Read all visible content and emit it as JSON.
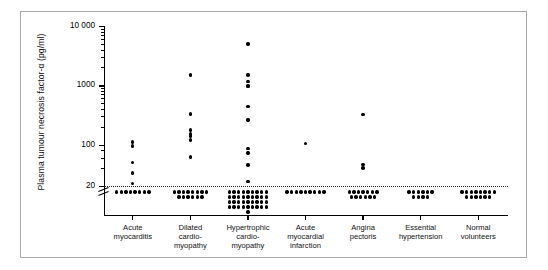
{
  "figure": {
    "background_color": "#ffffff",
    "border_color": "#a8a8a8",
    "marker_color": "#000000",
    "threshold_line_color": "#222222"
  },
  "axes": {
    "y_title": "Plasma tumour necrosis factor-α (pg/ml)",
    "y_tick_labels": [
      "10 000",
      "1000",
      "100",
      "20"
    ],
    "y_scale": "log",
    "y_axis_break": true,
    "x_title": ""
  },
  "chart_data": {
    "type": "scatter",
    "title": "",
    "subtitle": "",
    "xlabel": "",
    "ylabel": "Plasma tumour necrosis factor-α (pg/ml)",
    "yscale": "log",
    "ylim": [
      10,
      10000
    ],
    "yticks": [
      20,
      100,
      1000,
      10000
    ],
    "ytick_labels": [
      "20",
      "100",
      "1000",
      "10 000"
    ],
    "grid": false,
    "legend": "none",
    "annotations": [
      {
        "type": "hline",
        "value": 20,
        "style": "dotted",
        "label": "20",
        "note": "detection/normal upper reference limit"
      },
      {
        "type": "axis-break",
        "axis": "y",
        "below": 20,
        "note": "values below 20 pg/ml plotted as undetectable band"
      }
    ],
    "categories": [
      "Acute myocarditis",
      "Dilated cardiomyopathy",
      "Hypertrophic cardiomyopathy",
      "Acute myocardial infarction",
      "Angina pectoris",
      "Essential hypertension",
      "Normal volunteers"
    ],
    "category_labels_wrapped": [
      "Acute\nmyocarditis",
      "Dilated\ncardio-\nmyopathy",
      "Hypertrophic\ncardio-\nmyopathy",
      "Acute\nmyocardial\ninfarction",
      "Angina\npectoris",
      "Essential\nhypertension",
      "Normal\nvolunteers"
    ],
    "series": [
      {
        "name": "Acute myocarditis",
        "detected_values": [
          110,
          95,
          50,
          33,
          22
        ],
        "below_threshold_count": 8
      },
      {
        "name": "Dilated cardiomyopathy",
        "detected_values": [
          1500,
          330,
          175,
          150,
          140,
          120,
          62
        ],
        "below_threshold_count": 14
      },
      {
        "name": "Hypertrophic cardiomyopathy",
        "detected_values": [
          5000,
          1500,
          1150,
          1000,
          950,
          440,
          260,
          85,
          72,
          45,
          24
        ],
        "below_threshold_count": 37
      },
      {
        "name": "Acute myocardial infarction",
        "detected_values": [
          105
        ],
        "below_threshold_count": 9
      },
      {
        "name": "Angina pectoris",
        "detected_values": [
          320,
          46,
          40
        ],
        "below_threshold_count": 13
      },
      {
        "name": "Essential hypertension",
        "detected_values": [],
        "below_threshold_count": 10
      },
      {
        "name": "Normal volunteers",
        "detected_values": [],
        "below_threshold_count": 14
      }
    ]
  }
}
